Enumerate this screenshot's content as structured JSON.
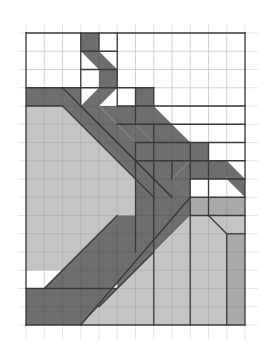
{
  "grid": {
    "origin_px": [
      26,
      33
    ],
    "cell_px": 18.25,
    "cols": 12,
    "rows": 16,
    "faint_extent_px": [
      18,
      24,
      258,
      340
    ],
    "faint_color": "#e6e6e6",
    "frame_color": "#3a3a3a"
  },
  "colors": {
    "dark": "#6e6e6e",
    "light": "#c4c4c4",
    "mid": "#a9a9a9",
    "white": "#ffffff",
    "edge": "#3a3a3a"
  },
  "shapes": [
    {
      "name": "light-left-region",
      "fill": "light",
      "pts": [
        [
          0,
          4
        ],
        [
          2,
          4
        ],
        [
          7,
          9
        ],
        [
          7,
          10
        ],
        [
          5,
          12
        ],
        [
          4,
          13
        ],
        [
          0,
          13
        ]
      ]
    },
    {
      "name": "dark-left-band-top",
      "fill": "dark",
      "pts": [
        [
          0,
          3
        ],
        [
          2,
          3
        ],
        [
          3,
          4
        ],
        [
          0,
          4
        ]
      ]
    },
    {
      "name": "dark-top-stem",
      "fill": "dark",
      "pts": [
        [
          3,
          0
        ],
        [
          4,
          0
        ],
        [
          4,
          1
        ],
        [
          3,
          1
        ]
      ]
    },
    {
      "name": "dark-zigzag-1",
      "fill": "dark",
      "pts": [
        [
          3,
          1
        ],
        [
          4,
          1
        ],
        [
          5,
          2
        ],
        [
          4,
          2
        ]
      ]
    },
    {
      "name": "dark-zigzag-2",
      "fill": "dark",
      "pts": [
        [
          4,
          2
        ],
        [
          5,
          2
        ],
        [
          5,
          3
        ],
        [
          4,
          3
        ]
      ]
    },
    {
      "name": "dark-zigzag-3",
      "fill": "dark",
      "pts": [
        [
          4,
          3
        ],
        [
          5,
          3
        ],
        [
          4,
          4
        ],
        [
          3,
          4
        ]
      ]
    },
    {
      "name": "dark-diagonal-upper",
      "fill": "dark",
      "pts": [
        [
          2,
          3
        ],
        [
          3,
          3
        ],
        [
          3,
          4
        ],
        [
          4,
          4
        ],
        [
          9,
          9
        ],
        [
          8,
          9
        ],
        [
          7,
          9
        ],
        [
          2,
          4
        ]
      ]
    },
    {
      "name": "dark-stair-a",
      "fill": "dark",
      "pts": [
        [
          5,
          4
        ],
        [
          6,
          4
        ],
        [
          6,
          3
        ],
        [
          7,
          3
        ],
        [
          7,
          4
        ],
        [
          8,
          5
        ],
        [
          7,
          6
        ],
        [
          6,
          5
        ],
        [
          5,
          5
        ]
      ]
    },
    {
      "name": "dark-stair-b",
      "fill": "dark",
      "pts": [
        [
          4,
          4
        ],
        [
          5,
          4
        ],
        [
          6,
          5
        ],
        [
          7,
          6
        ],
        [
          7,
          7
        ],
        [
          6,
          7
        ],
        [
          6,
          6
        ],
        [
          5,
          5
        ]
      ]
    },
    {
      "name": "dark-stair-c",
      "fill": "dark",
      "pts": [
        [
          7,
          5
        ],
        [
          8,
          5
        ],
        [
          9,
          6
        ],
        [
          10,
          6
        ],
        [
          10,
          7
        ],
        [
          9,
          7
        ],
        [
          8,
          8
        ],
        [
          8,
          7
        ],
        [
          7,
          7
        ],
        [
          7,
          6
        ]
      ]
    },
    {
      "name": "dark-stair-d",
      "fill": "dark",
      "pts": [
        [
          9,
          7
        ],
        [
          10,
          7
        ],
        [
          11,
          7
        ],
        [
          12,
          8
        ],
        [
          12,
          9
        ],
        [
          11,
          8
        ],
        [
          9,
          8
        ],
        [
          9,
          9
        ],
        [
          8,
          8
        ]
      ]
    },
    {
      "name": "dark-central-block",
      "fill": "dark",
      "pts": [
        [
          6,
          6
        ],
        [
          7,
          7
        ],
        [
          8,
          7
        ],
        [
          8,
          8
        ],
        [
          9,
          9
        ],
        [
          9,
          10
        ],
        [
          7,
          10
        ],
        [
          7,
          12
        ],
        [
          4,
          15
        ],
        [
          3,
          15
        ],
        [
          3,
          16
        ],
        [
          0,
          16
        ],
        [
          0,
          14
        ],
        [
          5,
          14
        ],
        [
          5,
          13
        ],
        [
          6,
          12
        ],
        [
          6,
          7
        ]
      ]
    },
    {
      "name": "dark-diagonal-lower",
      "fill": "dark",
      "pts": [
        [
          7,
          9
        ],
        [
          8,
          9
        ],
        [
          9,
          9
        ],
        [
          9,
          10
        ],
        [
          7,
          12
        ],
        [
          6,
          13
        ],
        [
          2,
          17
        ],
        [
          2,
          14
        ],
        [
          1,
          14
        ],
        [
          5,
          10
        ],
        [
          7,
          10
        ]
      ]
    },
    {
      "name": "dark-bottom-band",
      "fill": "dark",
      "pts": [
        [
          0,
          14
        ],
        [
          5,
          14
        ],
        [
          3,
          16
        ],
        [
          0,
          16
        ]
      ]
    },
    {
      "name": "light-bottom-right",
      "fill": "light",
      "pts": [
        [
          3,
          16
        ],
        [
          6,
          13
        ],
        [
          9,
          10
        ],
        [
          9,
          9
        ],
        [
          10,
          9
        ],
        [
          10,
          10
        ],
        [
          11,
          11
        ],
        [
          11,
          16
        ]
      ]
    },
    {
      "name": "light-right-top-strip",
      "fill": "mid",
      "pts": [
        [
          9,
          9
        ],
        [
          12,
          9
        ],
        [
          12,
          10
        ],
        [
          9,
          10
        ]
      ]
    },
    {
      "name": "mid-right-column",
      "fill": "mid",
      "pts": [
        [
          11,
          11
        ],
        [
          12,
          11
        ],
        [
          12,
          16
        ],
        [
          11,
          16
        ]
      ]
    },
    {
      "name": "light-right-notch",
      "fill": "light",
      "pts": [
        [
          10,
          10
        ],
        [
          12,
          10
        ],
        [
          12,
          11
        ],
        [
          11,
          11
        ]
      ]
    }
  ],
  "edges": [
    [
      [
        0,
        0
      ],
      [
        12,
        0
      ]
    ],
    [
      [
        12,
        0
      ],
      [
        12,
        16
      ]
    ],
    [
      [
        12,
        16
      ],
      [
        0,
        16
      ]
    ],
    [
      [
        0,
        16
      ],
      [
        0,
        0
      ]
    ],
    [
      [
        0,
        3
      ],
      [
        3,
        3
      ]
    ],
    [
      [
        0,
        4
      ],
      [
        2,
        4
      ]
    ],
    [
      [
        0,
        14
      ],
      [
        5,
        14
      ]
    ],
    [
      [
        3,
        0
      ],
      [
        3,
        4
      ]
    ],
    [
      [
        4,
        0
      ],
      [
        4,
        1
      ]
    ],
    [
      [
        5,
        0
      ],
      [
        5,
        4
      ]
    ],
    [
      [
        5,
        4
      ],
      [
        12,
        4
      ]
    ],
    [
      [
        2,
        4
      ],
      [
        7,
        9
      ]
    ],
    [
      [
        2,
        3
      ],
      [
        8,
        9
      ]
    ],
    [
      [
        3,
        4
      ],
      [
        8,
        9
      ]
    ],
    [
      [
        3,
        1
      ],
      [
        5,
        1
      ]
    ],
    [
      [
        3,
        2
      ],
      [
        5,
        2
      ]
    ],
    [
      [
        3,
        3
      ],
      [
        5,
        3
      ]
    ],
    [
      [
        5,
        3
      ],
      [
        7,
        3
      ]
    ],
    [
      [
        6,
        3
      ],
      [
        6,
        5
      ]
    ],
    [
      [
        7,
        3
      ],
      [
        7,
        4
      ]
    ],
    [
      [
        5,
        5
      ],
      [
        12,
        5
      ]
    ],
    [
      [
        7,
        5
      ],
      [
        7,
        16
      ]
    ],
    [
      [
        6,
        6
      ],
      [
        6,
        12
      ]
    ],
    [
      [
        6,
        6
      ],
      [
        12,
        6
      ]
    ],
    [
      [
        9,
        6
      ],
      [
        9,
        9
      ]
    ],
    [
      [
        10,
        6
      ],
      [
        10,
        10
      ]
    ],
    [
      [
        6,
        7
      ],
      [
        12,
        7
      ]
    ],
    [
      [
        8,
        7
      ],
      [
        8,
        8
      ]
    ],
    [
      [
        9,
        8
      ],
      [
        12,
        8
      ]
    ],
    [
      [
        9,
        9
      ],
      [
        12,
        9
      ]
    ],
    [
      [
        9,
        9
      ],
      [
        9,
        16
      ]
    ],
    [
      [
        9,
        10
      ],
      [
        12,
        10
      ]
    ],
    [
      [
        10,
        10
      ],
      [
        11,
        11
      ]
    ],
    [
      [
        11,
        11
      ],
      [
        11,
        16
      ]
    ],
    [
      [
        11,
        11
      ],
      [
        12,
        11
      ]
    ],
    [
      [
        9,
        9
      ],
      [
        3,
        16
      ]
    ],
    [
      [
        7,
        12
      ],
      [
        4,
        15
      ]
    ],
    [
      [
        1,
        14
      ],
      [
        5,
        10
      ]
    ]
  ]
}
